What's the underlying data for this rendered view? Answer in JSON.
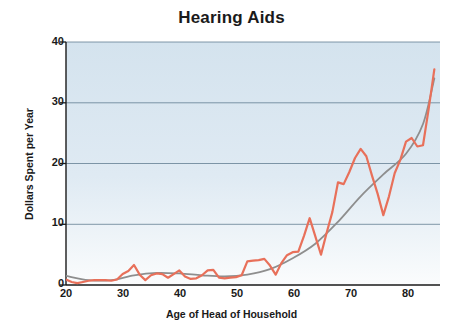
{
  "chart_data": {
    "type": "line",
    "title": "Hearing Aids",
    "xlabel": "Age of Head of Household",
    "ylabel": "Dollars Spent per Year",
    "xlim": [
      20,
      86
    ],
    "ylim": [
      0,
      40
    ],
    "grid": true,
    "grid_lines_y": [
      10,
      20,
      30,
      40
    ],
    "legend": "none",
    "xticks": [
      20,
      30,
      40,
      50,
      60,
      70,
      80
    ],
    "yticks": [
      0,
      10,
      20,
      30,
      40
    ],
    "plot_background": "#d6e4ef",
    "series": [
      {
        "name": "Observed spending",
        "color": "#e8705a",
        "style": "jagged-line",
        "x": [
          20,
          21,
          22,
          23,
          24,
          25,
          26,
          27,
          28,
          29,
          30,
          31,
          32,
          33,
          34,
          35,
          36,
          37,
          38,
          39,
          40,
          41,
          42,
          43,
          44,
          45,
          46,
          47,
          48,
          49,
          50,
          51,
          52,
          53,
          54,
          55,
          56,
          57,
          58,
          59,
          60,
          61,
          62,
          63,
          64,
          65,
          66,
          67,
          68,
          69,
          70,
          71,
          72,
          73,
          74,
          75,
          76,
          77,
          78,
          79,
          80,
          81,
          82,
          83,
          84,
          85
        ],
        "y": [
          0.9,
          0.5,
          0.3,
          0.5,
          0.7,
          0.8,
          0.8,
          0.8,
          0.7,
          0.9,
          1.8,
          2.3,
          3.3,
          1.7,
          0.8,
          1.6,
          1.9,
          1.8,
          1.2,
          1.8,
          2.4,
          1.4,
          1.0,
          1.1,
          1.6,
          2.4,
          2.5,
          1.2,
          1.1,
          1.2,
          1.3,
          1.6,
          3.9,
          4.0,
          4.1,
          4.3,
          3.2,
          1.7,
          3.6,
          4.9,
          5.4,
          5.5,
          8.1,
          11.0,
          8.0,
          5.0,
          8.6,
          12.0,
          16.9,
          16.6,
          18.6,
          20.9,
          22.4,
          21.2,
          18.0,
          15.0,
          11.5,
          14.6,
          18.4,
          20.6,
          23.6,
          24.2,
          22.8,
          23.0,
          29.0,
          35.5
        ]
      },
      {
        "name": "Smoothed trend",
        "color": "#8e8e8e",
        "style": "smooth-line",
        "x": [
          20,
          24,
          28,
          32,
          36,
          40,
          44,
          48,
          52,
          56,
          60,
          64,
          68,
          72,
          76,
          80,
          83,
          85
        ],
        "y": [
          1.5,
          0.8,
          0.8,
          1.6,
          2.0,
          1.9,
          1.6,
          1.4,
          1.7,
          2.6,
          4.4,
          6.8,
          10.4,
          14.6,
          18.2,
          21.6,
          26.5,
          34.0
        ]
      }
    ]
  },
  "axis": {
    "y_tick_labels": [
      "40",
      "30",
      "20",
      "10",
      "0"
    ],
    "x_tick_labels": [
      "20",
      "30",
      "40",
      "50",
      "60",
      "70",
      "80"
    ]
  }
}
